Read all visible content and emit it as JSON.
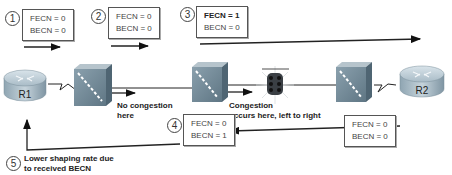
{
  "diagram": {
    "devices": [
      {
        "id": "r1",
        "type": "router",
        "label": "R1"
      },
      {
        "id": "sw1",
        "type": "frame-relay-switch",
        "label": ""
      },
      {
        "id": "sw2",
        "type": "frame-relay-switch",
        "label": ""
      },
      {
        "id": "congestion",
        "type": "congestion-traffic-light",
        "label": ""
      },
      {
        "id": "sw3",
        "type": "frame-relay-switch",
        "label": ""
      },
      {
        "id": "r2",
        "type": "router",
        "label": "R2"
      }
    ],
    "steps": [
      {
        "num": "1",
        "fecn": "FECN = 0",
        "becn": "BECN = 0"
      },
      {
        "num": "2",
        "fecn": "FECN = 0",
        "becn": "BECN = 0"
      },
      {
        "num": "3",
        "fecn": "FECN = 1",
        "becn": "BECN = 0"
      },
      {
        "num": "4",
        "fecn": "FECN = 0",
        "becn": "BECN = 1"
      },
      {
        "num": "5",
        "text_line1": "Lower shaping rate due",
        "text_line2": "to received BECN"
      }
    ],
    "return_box": {
      "fecn": "FECN = 0",
      "becn": "BECN = 0"
    },
    "annotations": {
      "no_congestion_line1": "No congestion",
      "no_congestion_line2": "here",
      "congestion_line1": "Congestion",
      "congestion_line2": "occurs here, left to right"
    }
  }
}
